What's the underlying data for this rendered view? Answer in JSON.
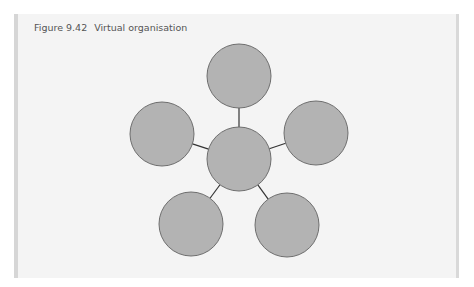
{
  "figure": {
    "number": "Figure 9.42",
    "title": "Virtual organisation"
  },
  "colors": {
    "page_background": "#ffffff",
    "panel_background": "#f4f4f4",
    "panel_border": "#d6d6d6",
    "node_fill": "#b3b3b3",
    "node_stroke": "#6e6e6e",
    "connector": "#333333",
    "title_text": "#555555"
  },
  "diagram": {
    "type": "hub-and-spoke",
    "hub": {
      "id": "center",
      "cx": 239,
      "cy": 159,
      "r": 32
    },
    "nodes": [
      {
        "id": "top",
        "cx": 239,
        "cy": 76,
        "r": 32
      },
      {
        "id": "left",
        "cx": 162,
        "cy": 134,
        "r": 32
      },
      {
        "id": "right",
        "cx": 316,
        "cy": 133,
        "r": 32
      },
      {
        "id": "bottom-left",
        "cx": 191,
        "cy": 224,
        "r": 32
      },
      {
        "id": "bottom-right",
        "cx": 287,
        "cy": 225,
        "r": 32
      }
    ],
    "connections": [
      {
        "from": "center",
        "to": "top"
      },
      {
        "from": "center",
        "to": "left"
      },
      {
        "from": "center",
        "to": "right"
      },
      {
        "from": "center",
        "to": "bottom-left"
      },
      {
        "from": "center",
        "to": "bottom-right"
      }
    ]
  }
}
